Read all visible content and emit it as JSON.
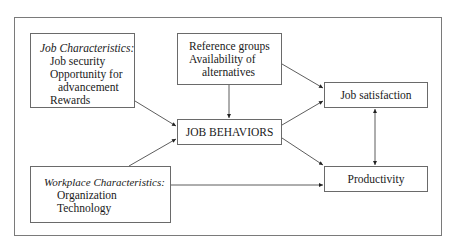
{
  "diagram": {
    "nodes": {
      "job_characteristics": {
        "title": "Job Characteristics:",
        "items": [
          "Job security",
          "Opportunity for",
          "advancement",
          "Rewards"
        ]
      },
      "reference_groups": {
        "lines": [
          "Reference groups",
          "Availability of",
          "alternatives"
        ]
      },
      "job_behaviors": {
        "label": "JOB BEHAVIORS"
      },
      "job_satisfaction": {
        "label": "Job satisfaction"
      },
      "productivity": {
        "label": "Productivity"
      },
      "workplace_characteristics": {
        "title": "Workplace Characteristics:",
        "items": [
          "Organization",
          "Technology"
        ]
      }
    },
    "edges": [
      {
        "from": "job_characteristics",
        "to": "job_behaviors",
        "type": "arrow"
      },
      {
        "from": "reference_groups",
        "to": "job_behaviors",
        "type": "arrow"
      },
      {
        "from": "reference_groups",
        "to": "job_satisfaction",
        "type": "arrow"
      },
      {
        "from": "workplace_characteristics",
        "to": "job_behaviors",
        "type": "arrow"
      },
      {
        "from": "workplace_characteristics",
        "to": "productivity",
        "type": "arrow"
      },
      {
        "from": "job_behaviors",
        "to": "job_satisfaction",
        "type": "arrow"
      },
      {
        "from": "job_behaviors",
        "to": "productivity",
        "type": "arrow"
      },
      {
        "from": "job_satisfaction",
        "to": "productivity",
        "type": "bidirectional"
      }
    ],
    "colors": {
      "border": "#6a6a6a",
      "line": "#222222",
      "text": "#1a1a1a"
    }
  }
}
